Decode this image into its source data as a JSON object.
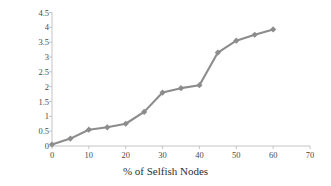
{
  "chart_data": {
    "type": "line",
    "title": "",
    "xlabel": "% of Selfish Nodes",
    "ylabel": "Delay (seconds)",
    "x": [
      0,
      5,
      10,
      15,
      20,
      25,
      30,
      35,
      40,
      45,
      50,
      55,
      60
    ],
    "values": [
      0.05,
      0.25,
      0.55,
      0.63,
      0.75,
      1.15,
      1.8,
      1.95,
      2.05,
      3.15,
      3.55,
      3.75,
      3.93
    ],
    "series": [
      {
        "name": "Delay",
        "values": [
          0.05,
          0.25,
          0.55,
          0.63,
          0.75,
          1.15,
          1.8,
          1.95,
          2.05,
          3.15,
          3.55,
          3.75,
          3.93
        ]
      }
    ],
    "xlim": [
      0,
      70
    ],
    "ylim": [
      0,
      4.5
    ],
    "xticks": [
      0,
      10,
      20,
      30,
      40,
      50,
      60,
      70
    ],
    "xtick_labels": [
      "0",
      "10",
      "20",
      "30",
      "40",
      "50",
      "60",
      "70"
    ],
    "yticks": [
      0,
      0.5,
      1,
      1.5,
      2,
      2.5,
      3,
      3.5,
      4,
      4.5
    ],
    "ytick_labels": [
      "0",
      "0.5",
      "1",
      "1.5",
      "2",
      "2.5",
      "3",
      "3.5",
      "4",
      "4.5"
    ],
    "grid": false,
    "legend": "none",
    "marker": "diamond",
    "line_color": "#8c8c8c",
    "marker_color": "#8c8c8c",
    "axis_color": "#b5b5b5",
    "background_color": "#ffffff"
  }
}
